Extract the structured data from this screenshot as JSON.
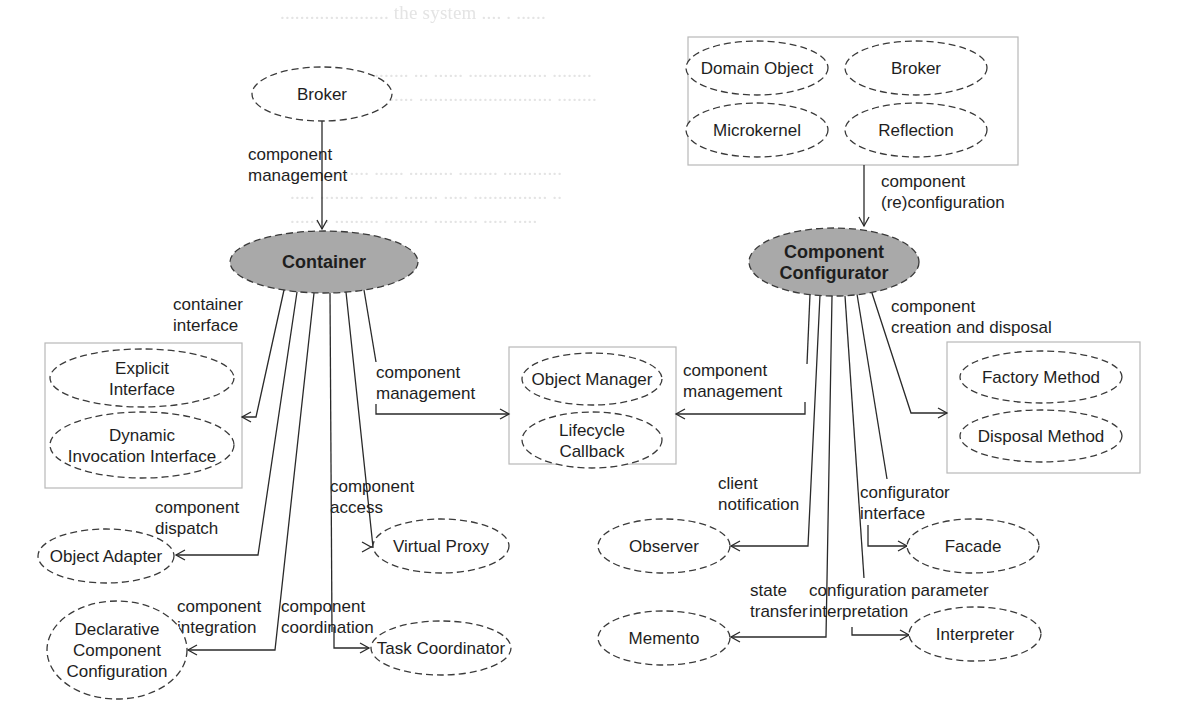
{
  "diagram": {
    "title": "",
    "background_ghost_text": [
      {
        "x": 280,
        "y": 2,
        "text": "...................... the system .... . ......"
      },
      {
        "x": 290,
        "y": 60,
        "text": "........................ ... ...... ................ ........"
      },
      {
        "x": 290,
        "y": 84,
        "text": "..... ........... ....... ........................... ........"
      },
      {
        "x": 290,
        "y": 158,
        "text": "....... ........ ...... ......... ........ ............"
      },
      {
        "x": 290,
        "y": 182,
        "text": "..... ......... ...... ....... ..... ............... .."
      },
      {
        "x": 290,
        "y": 206,
        "text": "........ ......... ......... ......... ..... ....."
      }
    ],
    "colors": {
      "core_fill": "#a9a9a9",
      "pattern_fill": "#ffffff",
      "stroke": "#3a3a3a",
      "group_border": "#b8b8b8",
      "text": "#1e1e1e"
    },
    "groups": [
      {
        "id": "grp-reconfig-patterns",
        "x": 688,
        "y": 37,
        "w": 330,
        "h": 128
      },
      {
        "id": "grp-container-interface",
        "x": 45,
        "y": 343,
        "w": 197,
        "h": 145
      },
      {
        "id": "grp-component-management",
        "x": 509,
        "y": 347,
        "w": 167,
        "h": 117
      },
      {
        "id": "grp-creation-disposal",
        "x": 947,
        "y": 342,
        "w": 193,
        "h": 131
      }
    ],
    "nodes": [
      {
        "id": "broker-top",
        "kind": "pattern",
        "cx": 322,
        "cy": 94,
        "rx": 70,
        "ry": 27,
        "lines": [
          "Broker"
        ]
      },
      {
        "id": "container",
        "kind": "core",
        "cx": 324,
        "cy": 262,
        "rx": 94,
        "ry": 31,
        "lines": [
          "Container"
        ]
      },
      {
        "id": "component-configurator",
        "kind": "core",
        "cx": 834,
        "cy": 262,
        "rx": 85,
        "ry": 34,
        "lines": [
          "Component",
          "Configurator"
        ]
      },
      {
        "id": "domain-object",
        "kind": "pattern",
        "cx": 757,
        "cy": 68,
        "rx": 71,
        "ry": 27,
        "lines": [
          "Domain Object"
        ]
      },
      {
        "id": "broker-right",
        "kind": "pattern",
        "cx": 916,
        "cy": 68,
        "rx": 71,
        "ry": 27,
        "lines": [
          "Broker"
        ]
      },
      {
        "id": "microkernel",
        "kind": "pattern",
        "cx": 757,
        "cy": 130,
        "rx": 71,
        "ry": 27,
        "lines": [
          "Microkernel"
        ]
      },
      {
        "id": "reflection",
        "kind": "pattern",
        "cx": 916,
        "cy": 130,
        "rx": 71,
        "ry": 27,
        "lines": [
          "Reflection"
        ]
      },
      {
        "id": "explicit-interface",
        "kind": "pattern",
        "cx": 142,
        "cy": 378,
        "rx": 92,
        "ry": 29,
        "lines": [
          "Explicit",
          "Interface"
        ]
      },
      {
        "id": "dynamic-invocation-interface",
        "kind": "pattern",
        "cx": 142,
        "cy": 445,
        "rx": 92,
        "ry": 33,
        "lines": [
          "Dynamic",
          "Invocation Interface"
        ]
      },
      {
        "id": "object-manager",
        "kind": "pattern",
        "cx": 592,
        "cy": 379,
        "rx": 70,
        "ry": 26,
        "lines": [
          "Object Manager"
        ]
      },
      {
        "id": "lifecycle-callback",
        "kind": "pattern",
        "cx": 592,
        "cy": 440,
        "rx": 70,
        "ry": 28,
        "lines": [
          "Lifecycle",
          "Callback"
        ]
      },
      {
        "id": "factory-method",
        "kind": "pattern",
        "cx": 1041,
        "cy": 377,
        "rx": 81,
        "ry": 26,
        "lines": [
          "Factory Method"
        ]
      },
      {
        "id": "disposal-method",
        "kind": "pattern",
        "cx": 1041,
        "cy": 436,
        "rx": 81,
        "ry": 26,
        "lines": [
          "Disposal Method"
        ]
      },
      {
        "id": "object-adapter",
        "kind": "pattern",
        "cx": 106,
        "cy": 556,
        "rx": 68,
        "ry": 27,
        "lines": [
          "Object Adapter"
        ]
      },
      {
        "id": "virtual-proxy",
        "kind": "pattern",
        "cx": 441,
        "cy": 546,
        "rx": 68,
        "ry": 27,
        "lines": [
          "Virtual Proxy"
        ]
      },
      {
        "id": "declarative-component-configuration",
        "kind": "pattern",
        "cx": 117,
        "cy": 650,
        "rx": 70,
        "ry": 49,
        "lines": [
          "Declarative",
          "Component",
          "Configuration"
        ]
      },
      {
        "id": "task-coordinator",
        "kind": "pattern",
        "cx": 441,
        "cy": 648,
        "rx": 70,
        "ry": 27,
        "lines": [
          "Task Coordinator"
        ]
      },
      {
        "id": "observer",
        "kind": "pattern",
        "cx": 664,
        "cy": 546,
        "rx": 66,
        "ry": 27,
        "lines": [
          "Observer"
        ]
      },
      {
        "id": "memento",
        "kind": "pattern",
        "cx": 664,
        "cy": 638,
        "rx": 66,
        "ry": 27,
        "lines": [
          "Memento"
        ]
      },
      {
        "id": "facade",
        "kind": "pattern",
        "cx": 973,
        "cy": 546,
        "rx": 66,
        "ry": 27,
        "lines": [
          "Facade"
        ]
      },
      {
        "id": "interpreter",
        "kind": "pattern",
        "cx": 975,
        "cy": 634,
        "rx": 66,
        "ry": 27,
        "lines": [
          "Interpreter"
        ]
      }
    ],
    "edges": [
      {
        "id": "edge-broker-container",
        "points": [
          [
            322,
            121
          ],
          [
            322,
            229
          ]
        ],
        "arrow": "down",
        "label": [
          "component",
          "management"
        ],
        "lx": 248,
        "ly": 160,
        "anchor": "start"
      },
      {
        "id": "edge-reconfiguration",
        "points": [
          [
            864,
            165
          ],
          [
            864,
            226
          ]
        ],
        "arrow": "down",
        "label": [
          "component",
          "(re)configuration"
        ],
        "lx": 881,
        "ly": 187,
        "anchor": "start"
      },
      {
        "id": "edge-container-interface",
        "points": [
          [
            284,
            290
          ],
          [
            256,
            417
          ],
          [
            242,
            417
          ]
        ],
        "arrow": "left",
        "label": [
          "container",
          "interface"
        ],
        "lx": 173,
        "ly": 310,
        "anchor": "start"
      },
      {
        "id": "edge-container-dispatch",
        "points": [
          [
            297,
            292
          ],
          [
            258,
            555
          ],
          [
            176,
            555
          ]
        ],
        "arrow": "left",
        "label": [
          "component",
          "dispatch"
        ],
        "lx": 155,
        "ly": 513,
        "anchor": "start"
      },
      {
        "id": "edge-container-integration",
        "points": [
          [
            314,
            293
          ],
          [
            275,
            650
          ],
          [
            272,
            650
          ],
          [
            237,
            650
          ],
          [
            188,
            650
          ]
        ],
        "arrow": "left",
        "label": [
          "component",
          "integration"
        ],
        "lx": 177,
        "ly": 612,
        "anchor": "start"
      },
      {
        "id": "edge-container-coordination",
        "points": [
          [
            330,
            293
          ],
          [
            332,
            632
          ]
        ],
        "arrow": "none",
        "label": [
          "component",
          "coordination"
        ],
        "lx": 281,
        "ly": 612,
        "anchor": "start"
      },
      {
        "id": "edge-coordination-task",
        "points": [
          [
            334,
            627
          ],
          [
            334,
            648
          ],
          [
            369,
            648
          ]
        ],
        "arrow": "right",
        "label": [],
        "lx": 0,
        "ly": 0,
        "anchor": "start"
      },
      {
        "id": "edge-container-access",
        "points": [
          [
            346,
            292
          ],
          [
            373,
            547
          ],
          [
            371,
            547
          ]
        ],
        "arrow": "right-to",
        "to": [
          371,
          547
        ],
        "label": [
          "component",
          "access"
        ],
        "lx": 330,
        "ly": 492,
        "anchor": "start"
      },
      {
        "id": "edge-container-management",
        "points": [
          [
            364,
            290
          ],
          [
            376,
            362
          ]
        ],
        "arrow": "none",
        "label": [
          "component",
          "management"
        ],
        "lx": 376,
        "ly": 378,
        "anchor": "start"
      },
      {
        "id": "edge-management-objectmgr",
        "points": [
          [
            376,
            404
          ],
          [
            376,
            414
          ],
          [
            509,
            414
          ]
        ],
        "arrow": "right",
        "label": [],
        "lx": 0,
        "ly": 0,
        "anchor": "start"
      },
      {
        "id": "edge-configurator-management",
        "points": [
          [
            810,
            294
          ],
          [
            807,
            364
          ]
        ],
        "arrow": "none",
        "label": [
          "component",
          "management"
        ],
        "lx": 683,
        "ly": 376,
        "anchor": "start"
      },
      {
        "id": "edge-management-lifecycle",
        "points": [
          [
            805,
            402
          ],
          [
            805,
            414
          ],
          [
            676,
            414
          ]
        ],
        "arrow": "left",
        "label": [],
        "lx": 0,
        "ly": 0,
        "anchor": "start"
      },
      {
        "id": "edge-configurator-notification",
        "points": [
          [
            820,
            295
          ],
          [
            808,
            546
          ],
          [
            731,
            546
          ]
        ],
        "arrow": "left",
        "label": [
          "client",
          "notification"
        ],
        "lx": 718,
        "ly": 489,
        "anchor": "start"
      },
      {
        "id": "edge-configurator-state",
        "points": [
          [
            832,
            296
          ],
          [
            826,
            637
          ],
          [
            731,
            637
          ]
        ],
        "arrow": "left",
        "label": [
          "state",
          "transfer"
        ],
        "lx": 750,
        "ly": 596,
        "anchor": "start"
      },
      {
        "id": "edge-configurator-parameter",
        "points": [
          [
            845,
            296
          ],
          [
            864,
            578
          ]
        ],
        "arrow": "none",
        "label": [
          "configuration parameter",
          "interpretation"
        ],
        "lx": 809,
        "ly": 596,
        "anchor": "start"
      },
      {
        "id": "edge-parameter-interpreter",
        "points": [
          [
            852,
            627
          ],
          [
            852,
            635
          ],
          [
            909,
            635
          ]
        ],
        "arrow": "right",
        "label": [],
        "lx": 0,
        "ly": 0,
        "anchor": "start"
      },
      {
        "id": "edge-configurator-interface",
        "points": [
          [
            857,
            294
          ],
          [
            887,
            479
          ]
        ],
        "arrow": "none",
        "label": [
          "configurator",
          "interface"
        ],
        "lx": 860,
        "ly": 498,
        "anchor": "start"
      },
      {
        "id": "edge-interface-facade",
        "points": [
          [
            868,
            525
          ],
          [
            868,
            546
          ],
          [
            907,
            546
          ]
        ],
        "arrow": "right",
        "label": [],
        "lx": 0,
        "ly": 0,
        "anchor": "start"
      },
      {
        "id": "edge-configurator-creation",
        "points": [
          [
            871,
            290
          ],
          [
            911,
            413
          ],
          [
            947,
            413
          ]
        ],
        "arrow": "right",
        "label": [
          "component",
          "creation and disposal"
        ],
        "lx": 891,
        "ly": 312,
        "anchor": "start"
      }
    ]
  }
}
